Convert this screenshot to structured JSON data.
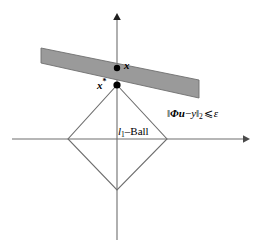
{
  "figure": {
    "background_color": "#ffffff",
    "width": 263,
    "height": 247
  },
  "colors": {
    "axis": "#6e6e6e",
    "slab_fill": "#9a9a9a",
    "slab_stroke": "#707070",
    "ball_stroke": "#6e6e6e",
    "point": "#000000",
    "text": "#000000"
  },
  "axes": {
    "horizontal": {
      "name": "horizontal-axis",
      "y": 139,
      "x_start": 12,
      "x_end": 248,
      "arrow": "right"
    },
    "vertical": {
      "name": "vertical-axis",
      "x": 117,
      "y_start": 240,
      "y_end": 14,
      "arrow": "up"
    },
    "origin": {
      "x": 117,
      "y": 139
    }
  },
  "l1_ball": {
    "label": "l",
    "label_sub": "1",
    "label_suffix": "–Ball",
    "vertices": [
      {
        "x": 117,
        "y": 85
      },
      {
        "x": 167,
        "y": 139
      },
      {
        "x": 117,
        "y": 190
      },
      {
        "x": 68,
        "y": 139
      }
    ]
  },
  "slab": {
    "name": "constraint-slab",
    "corners": [
      {
        "x": 41,
        "y": 48
      },
      {
        "x": 199,
        "y": 80
      },
      {
        "x": 199,
        "y": 98
      },
      {
        "x": 41,
        "y": 63
      }
    ],
    "constraint_label": {
      "norm_open": "‖",
      "operator": "Φu",
      "minus": "−",
      "variable": "y",
      "norm_close": "‖",
      "subscript": "2",
      "relation": "⩽",
      "epsilon": "ε"
    }
  },
  "points": [
    {
      "name": "point-x",
      "label": "x",
      "superscript": "",
      "x": 117,
      "y": 68,
      "radius": 3.2
    },
    {
      "name": "point-x-star",
      "label": "x",
      "superscript": "*",
      "x": 117,
      "y": 85,
      "radius": 3.6
    }
  ]
}
